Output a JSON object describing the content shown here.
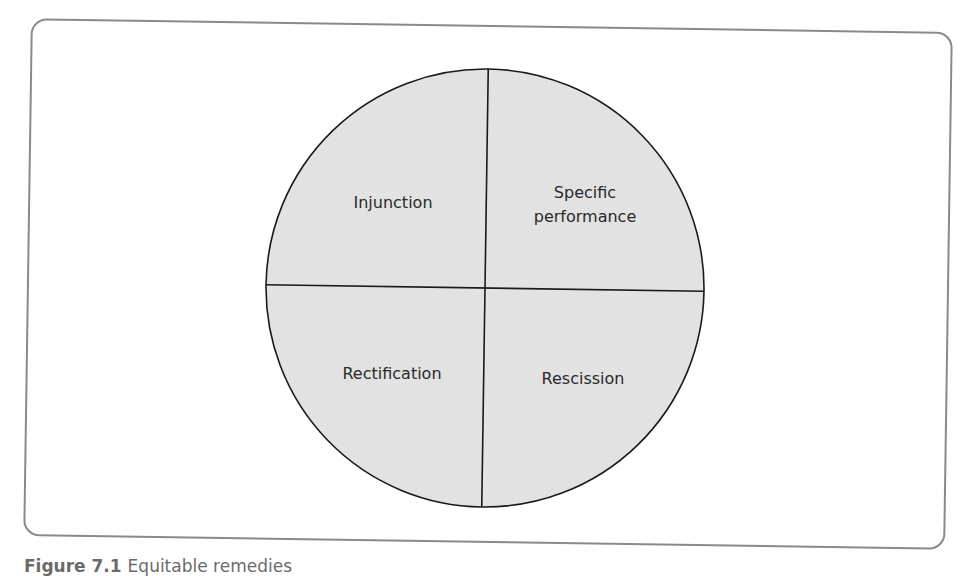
{
  "diagram": {
    "type": "quadrant-circle",
    "quadrants": [
      {
        "position": "top-left",
        "label_lines": [
          "Injunction"
        ]
      },
      {
        "position": "top-right",
        "label_lines": [
          "Specific",
          "performance"
        ]
      },
      {
        "position": "bottom-left",
        "label_lines": [
          "Rectification"
        ]
      },
      {
        "position": "bottom-right",
        "label_lines": [
          "Rescission"
        ]
      }
    ],
    "colors": {
      "fill": "#e2e2e2",
      "stroke": "#1a1a1a",
      "panel_border": "#8a8a8a"
    }
  },
  "caption": {
    "figure_label": "Figure 7.1",
    "text": "Equitable remedies"
  }
}
